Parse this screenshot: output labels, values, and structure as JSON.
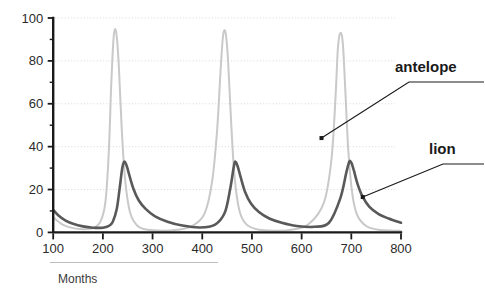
{
  "chart_data": {
    "type": "line",
    "title": "",
    "xlabel": "Months",
    "ylabel": "",
    "xlim": [
      100,
      800
    ],
    "ylim": [
      0,
      100
    ],
    "grid": true,
    "grid_axis": "y",
    "legend": "inline-annotations",
    "x_ticks": [
      100,
      200,
      300,
      400,
      500,
      600,
      700,
      800
    ],
    "x_tick_labels": [
      "100",
      "200",
      "300",
      "400",
      "500",
      "600",
      "700",
      "800"
    ],
    "y_ticks": [
      0,
      20,
      40,
      60,
      80,
      100
    ],
    "y_tick_labels": [
      "0",
      "20",
      "40",
      "60",
      "80",
      "100"
    ],
    "y_minor_ticks": [
      10,
      30,
      50,
      70,
      90
    ],
    "series": [
      {
        "name": "antelope",
        "color": "#c9c9c9",
        "stroke_width": 2.0,
        "peak_value": 93,
        "peak_x": [
          222,
          444,
          676
        ],
        "trough_value": 0.5,
        "x": [
          100,
          120,
          140,
          160,
          180,
          195,
          205,
          212,
          217,
          222,
          227,
          232,
          238,
          245,
          255,
          270,
          290,
          320,
          350,
          380,
          405,
          420,
          430,
          437,
          442,
          447,
          452,
          458,
          465,
          475,
          490,
          515,
          545,
          580,
          615,
          645,
          660,
          668,
          673,
          678,
          683,
          688,
          694,
          702,
          712,
          730,
          755,
          785,
          800
        ],
        "y": [
          7,
          3.5,
          2,
          1.5,
          2,
          5,
          14,
          38,
          70,
          92,
          93,
          78,
          48,
          24,
          9,
          3,
          1.2,
          0.8,
          1.2,
          3,
          9,
          24,
          48,
          76,
          92,
          93,
          80,
          52,
          26,
          10,
          3.5,
          1.2,
          0.8,
          1.2,
          4,
          14,
          34,
          62,
          86,
          93,
          88,
          66,
          38,
          18,
          8,
          3,
          1.2,
          0.8,
          0.7
        ]
      },
      {
        "name": "lion",
        "color": "#595959",
        "stroke_width": 2.6,
        "peak_value": 33,
        "peak_x": [
          243,
          466,
          697
        ],
        "trough_value": 1.5,
        "x": [
          100,
          110,
          125,
          140,
          160,
          180,
          200,
          212,
          220,
          228,
          234,
          239,
          243,
          248,
          254,
          262,
          272,
          286,
          305,
          330,
          360,
          395,
          425,
          445,
          456,
          463,
          466,
          471,
          477,
          486,
          498,
          514,
          535,
          560,
          590,
          625,
          655,
          678,
          690,
          696,
          700,
          705,
          712,
          722,
          736,
          755,
          775,
          800
        ],
        "y": [
          10.5,
          8,
          5.5,
          4,
          2.8,
          2.2,
          2.2,
          3,
          5,
          11,
          21,
          30,
          33,
          31,
          26,
          20,
          15,
          11,
          7.5,
          5,
          3.2,
          2.3,
          3.5,
          9,
          20,
          30,
          33,
          31,
          26,
          19,
          13.5,
          9.5,
          6.5,
          4.5,
          3,
          2.6,
          4.5,
          16,
          28,
          33,
          32.5,
          29,
          23,
          17,
          12,
          8.5,
          6.5,
          4.5
        ]
      }
    ],
    "annotations": [
      {
        "label": "antelope",
        "target_series": "antelope",
        "target_point": {
          "x": 640,
          "y": 44
        },
        "label_pos": {
          "x": 395,
          "y": 72
        }
      },
      {
        "label": "lion",
        "target_series": "lion",
        "target_point": {
          "x": 723,
          "y": 16.5
        },
        "label_pos": {
          "x": 429,
          "y": 154
        }
      }
    ]
  },
  "figure": {
    "x_caption": "Months"
  }
}
